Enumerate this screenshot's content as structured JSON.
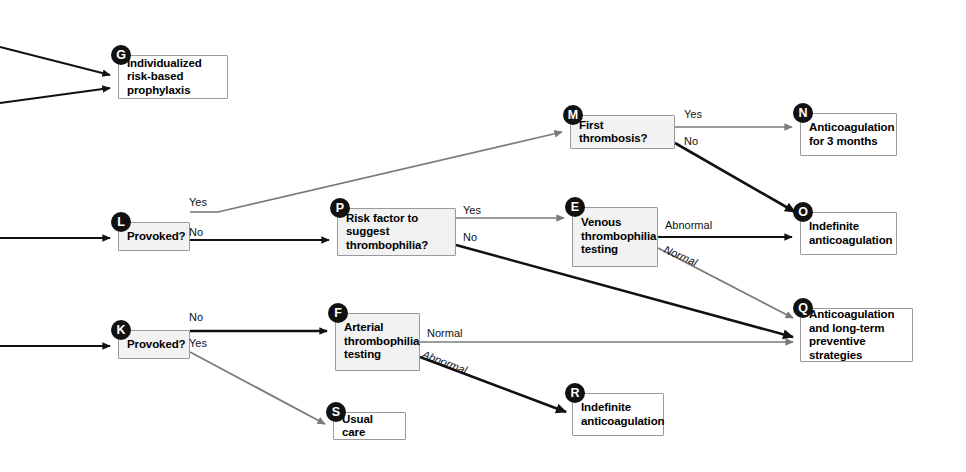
{
  "diagram": {
    "type": "clinical-decision-flowchart",
    "canvas": {
      "width": 966,
      "height": 472
    },
    "colors": {
      "box_fill": "#f2f2f2",
      "box_fill_alt": "#ffffff",
      "box_border": "#9a9a9a",
      "badge_fill": "#111111",
      "badge_text": "#ffffff",
      "edge_dark": "#111111",
      "edge_gray": "#7b7b7b",
      "text": "#000000"
    },
    "nodes": [
      {
        "id": "G",
        "badge": "G",
        "label": "Individualized risk-based prophylaxis",
        "x": 118,
        "y": 55,
        "w": 110,
        "h": 44,
        "fill": "alt"
      },
      {
        "id": "M",
        "badge": "M",
        "label": "First thrombosis?",
        "x": 570,
        "y": 115,
        "w": 105,
        "h": 34,
        "fill": "gray"
      },
      {
        "id": "N",
        "badge": "N",
        "label": "Anticoagulation for 3 months",
        "x": 800,
        "y": 113,
        "w": 97,
        "h": 43,
        "fill": "alt"
      },
      {
        "id": "L",
        "badge": "L",
        "label": "Provoked?",
        "x": 118,
        "y": 222,
        "w": 72,
        "h": 29,
        "fill": "gray"
      },
      {
        "id": "P",
        "badge": "P",
        "label": "Risk factor to suggest thrombophilia?",
        "x": 337,
        "y": 208,
        "w": 119,
        "h": 48,
        "fill": "gray"
      },
      {
        "id": "E",
        "badge": "E",
        "label": "Venous thrombophilia testing",
        "x": 572,
        "y": 207,
        "w": 86,
        "h": 60,
        "fill": "gray"
      },
      {
        "id": "O",
        "badge": "O",
        "label": "Indefinite anticoagulation",
        "x": 800,
        "y": 212,
        "w": 97,
        "h": 43,
        "fill": "alt"
      },
      {
        "id": "K",
        "badge": "K",
        "label": "Provoked?",
        "x": 118,
        "y": 330,
        "w": 72,
        "h": 29,
        "fill": "gray"
      },
      {
        "id": "F",
        "badge": "F",
        "label": "Arterial thrombophilia testing",
        "x": 335,
        "y": 313,
        "w": 85,
        "h": 58,
        "fill": "gray"
      },
      {
        "id": "Q",
        "badge": "Q",
        "label": "Anticoagulation and long-term preventive strategies",
        "x": 800,
        "y": 308,
        "w": 113,
        "h": 54,
        "fill": "alt"
      },
      {
        "id": "S",
        "badge": "S",
        "label": "Usual care",
        "x": 333,
        "y": 412,
        "w": 73,
        "h": 28,
        "fill": "alt"
      },
      {
        "id": "R",
        "badge": "R",
        "label": "Indefinite anticoagulation",
        "x": 572,
        "y": 393,
        "w": 92,
        "h": 43,
        "fill": "alt"
      }
    ],
    "edge_labels": [
      {
        "id": "m-yes",
        "text": "Yes",
        "x": 684,
        "y": 108,
        "italic": false
      },
      {
        "id": "m-no",
        "text": "No",
        "x": 684,
        "y": 135,
        "italic": false
      },
      {
        "id": "l-yes",
        "text": "Yes",
        "x": 189,
        "y": 196,
        "italic": false
      },
      {
        "id": "l-no",
        "text": "No",
        "x": 189,
        "y": 226,
        "italic": false
      },
      {
        "id": "p-yes",
        "text": "Yes",
        "x": 463,
        "y": 204,
        "italic": false
      },
      {
        "id": "p-no",
        "text": "No",
        "x": 463,
        "y": 231,
        "italic": false
      },
      {
        "id": "e-abnormal",
        "text": "Abnormal",
        "x": 665,
        "y": 219,
        "italic": false
      },
      {
        "id": "e-normal",
        "text": "Normal",
        "x": 667,
        "y": 243,
        "italic": true
      },
      {
        "id": "k-no",
        "text": "No",
        "x": 189,
        "y": 311,
        "italic": false
      },
      {
        "id": "k-yes",
        "text": "Yes",
        "x": 189,
        "y": 337,
        "italic": false
      },
      {
        "id": "f-normal",
        "text": "Normal",
        "x": 427,
        "y": 327,
        "italic": false
      },
      {
        "id": "f-abnormal",
        "text": "Abnormal",
        "x": 425,
        "y": 348,
        "italic": true
      }
    ],
    "edges": [
      {
        "id": "in-g-upper",
        "from": "offscreen-left",
        "to": "G",
        "tone": "dark"
      },
      {
        "id": "in-g-lower",
        "from": "offscreen-left",
        "to": "G",
        "tone": "dark"
      },
      {
        "id": "in-l",
        "from": "offscreen-left",
        "to": "L",
        "tone": "dark"
      },
      {
        "id": "in-k",
        "from": "offscreen-left",
        "to": "K",
        "tone": "dark"
      },
      {
        "id": "l-yes-m",
        "from": "L",
        "to": "M",
        "label": "Yes",
        "tone": "gray"
      },
      {
        "id": "l-no-p",
        "from": "L",
        "to": "P",
        "label": "No",
        "tone": "dark"
      },
      {
        "id": "m-yes-n",
        "from": "M",
        "to": "N",
        "label": "Yes",
        "tone": "gray"
      },
      {
        "id": "m-no-o",
        "from": "M",
        "to": "O",
        "label": "No",
        "tone": "dark"
      },
      {
        "id": "p-yes-e",
        "from": "P",
        "to": "E",
        "label": "Yes",
        "tone": "gray"
      },
      {
        "id": "p-no-q",
        "from": "P",
        "to": "Q",
        "label": "No",
        "tone": "dark"
      },
      {
        "id": "e-abnormal-o",
        "from": "E",
        "to": "O",
        "label": "Abnormal",
        "tone": "dark"
      },
      {
        "id": "e-normal-q",
        "from": "E",
        "to": "Q",
        "label": "Normal",
        "tone": "gray"
      },
      {
        "id": "k-no-f",
        "from": "K",
        "to": "F",
        "label": "No",
        "tone": "dark"
      },
      {
        "id": "k-yes-s",
        "from": "K",
        "to": "S",
        "label": "Yes",
        "tone": "gray"
      },
      {
        "id": "f-normal-q",
        "from": "F",
        "to": "Q",
        "label": "Normal",
        "tone": "gray"
      },
      {
        "id": "f-abnormal-r",
        "from": "F",
        "to": "R",
        "label": "Abnormal",
        "tone": "dark"
      }
    ]
  }
}
